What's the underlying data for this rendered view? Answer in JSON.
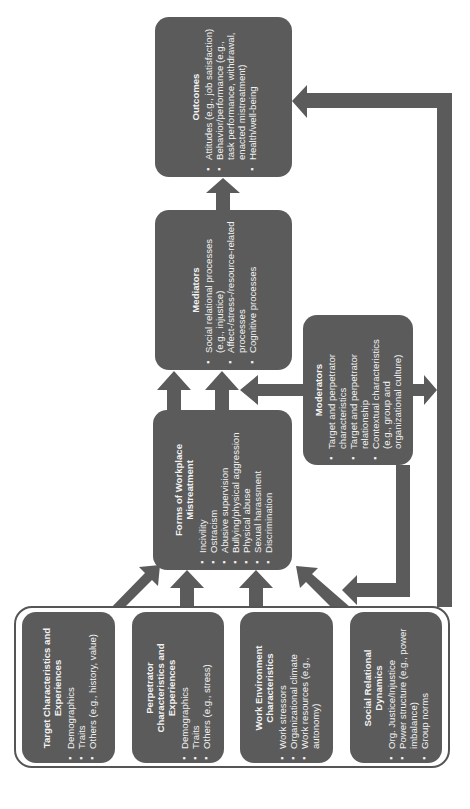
{
  "diagram": {
    "orientation": "rotated-90-ccw",
    "colors": {
      "box_fill": "#5b5b5b",
      "text": "#f2f2f2",
      "arrow": "#5b5b5b",
      "background": "#ffffff"
    },
    "outcomes": {
      "title": "Outcomes",
      "items": [
        "Attitudes (e.g., job satisfaction)",
        "Behavior/performance (e.g., task performance, withdrawal, enacted mistreatment)",
        "Health/well-being"
      ]
    },
    "mediators": {
      "title": "Mediators",
      "items": [
        "Social relational processes (e.g., injustice)",
        "Affect-/stress-/resource-related processes",
        "Cognitive processes"
      ]
    },
    "forms": {
      "title": "Forms of Workplace Mistreatment",
      "items": [
        "Incivility",
        "Ostracism",
        "Abusive supervision",
        "Bullying/physical aggression",
        "Physical abuse",
        "Sexual harassment",
        "Discrimination"
      ]
    },
    "moderators": {
      "title": "Moderators",
      "items": [
        "Target and perpetrator characteristics",
        "Target and perpetrator relationship",
        "Contextual characteristics (e.g., group and organizational culture)"
      ]
    },
    "antecedents": [
      {
        "title": "Target Characteristics and Experiences",
        "items": [
          "Demographics",
          "Traits",
          "Others (e.g., history, value)"
        ]
      },
      {
        "title": "Perpetrator Characteristics and Experiences",
        "items": [
          "Demographics",
          "Traits",
          "Others (e.g., stress)"
        ]
      },
      {
        "title": "Work Environment Characteristics",
        "items": [
          "Work stressors",
          "Organizational climate",
          "Work resources (e.g., autonomy)"
        ]
      },
      {
        "title": "Social Relational Dynamics",
        "items": [
          "Org. Justice/Injustice",
          "Power structure (e.g., power imbalance)",
          "Group norms"
        ]
      }
    ]
  }
}
